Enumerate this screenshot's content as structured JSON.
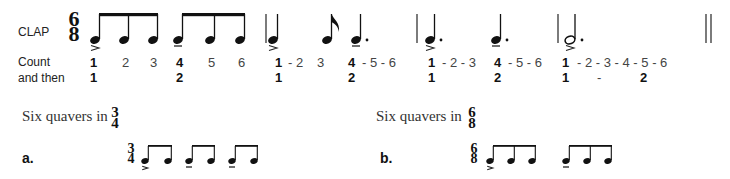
{
  "exercise": {
    "clap_label": "CLAP",
    "time_signature": {
      "top": "6",
      "bottom": "8"
    },
    "count_label": "Count",
    "and_then_label": "and then",
    "count_row": [
      {
        "text": "1",
        "bold": true
      },
      {
        "text": "2",
        "bold": false
      },
      {
        "text": "3",
        "bold": false
      },
      {
        "text": "4",
        "bold": true
      },
      {
        "text": "5",
        "bold": false
      },
      {
        "text": "6",
        "bold": false
      },
      {
        "text": "1",
        "bold": true
      },
      {
        "text": "- 2",
        "bold": false
      },
      {
        "text": "3",
        "bold": false
      },
      {
        "text": "4",
        "bold": true
      },
      {
        "text": "- 5 - 6",
        "bold": false
      },
      {
        "text": "1",
        "bold": true
      },
      {
        "text": "- 2 - 3",
        "bold": false
      },
      {
        "text": "4",
        "bold": true
      },
      {
        "text": "- 5 - 6",
        "bold": false
      },
      {
        "text": "1",
        "bold": true
      },
      {
        "text": "- 2 - 3 - 4 - 5 - 6",
        "bold": false
      }
    ],
    "then_row": [
      "1",
      "2",
      "1",
      "2",
      "1",
      "2",
      "1",
      "-",
      "2"
    ],
    "bars": [
      {
        "rhythm": "six quavers beamed in two groups of three",
        "accents": [
          ">",
          "-"
        ]
      },
      {
        "rhythm": "crotchet, quaver, dotted crotchet",
        "accents": [
          ">",
          "-"
        ]
      },
      {
        "rhythm": "two dotted crotchets",
        "accents": [
          ">",
          "-"
        ]
      },
      {
        "rhythm": "dotted minim",
        "accents": [
          ">"
        ]
      }
    ]
  },
  "examples": [
    {
      "heading": "Six quavers in",
      "heading_time_signature": {
        "top": "3",
        "bottom": "4"
      },
      "letter": "a.",
      "time_signature": {
        "top": "3",
        "bottom": "4"
      },
      "grouping": "three groups of two quavers"
    },
    {
      "heading": "Six quavers in",
      "heading_time_signature": {
        "top": "6",
        "bottom": "8"
      },
      "letter": "b.",
      "time_signature": {
        "top": "6",
        "bottom": "8"
      },
      "grouping": "two groups of three quavers"
    }
  ]
}
